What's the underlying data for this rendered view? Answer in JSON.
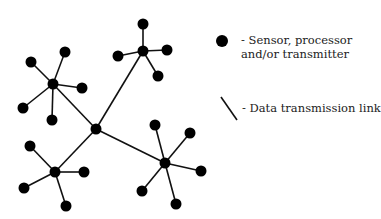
{
  "diagram": {
    "type": "network",
    "colors": {
      "node": "#000000",
      "link": "#111111"
    },
    "hubs": [
      {
        "id": "center",
        "x": 96,
        "y": 129
      },
      {
        "id": "upper-left",
        "x": 53,
        "y": 84
      },
      {
        "id": "top",
        "x": 143,
        "y": 51
      },
      {
        "id": "lower-left",
        "x": 55,
        "y": 172
      },
      {
        "id": "lower-right",
        "x": 165,
        "y": 163
      }
    ],
    "hub_links": [
      [
        "center",
        "upper-left"
      ],
      [
        "center",
        "top"
      ],
      [
        "center",
        "lower-left"
      ],
      [
        "center",
        "lower-right"
      ]
    ],
    "leaves": [
      {
        "hub": "upper-left",
        "x": 31,
        "y": 62
      },
      {
        "hub": "upper-left",
        "x": 65,
        "y": 52
      },
      {
        "hub": "upper-left",
        "x": 82,
        "y": 88
      },
      {
        "hub": "upper-left",
        "x": 23,
        "y": 108
      },
      {
        "hub": "upper-left",
        "x": 52,
        "y": 120
      },
      {
        "hub": "top",
        "x": 143,
        "y": 24
      },
      {
        "hub": "top",
        "x": 118,
        "y": 56
      },
      {
        "hub": "top",
        "x": 167,
        "y": 50
      },
      {
        "hub": "top",
        "x": 158,
        "y": 76
      },
      {
        "hub": "lower-left",
        "x": 30,
        "y": 146
      },
      {
        "hub": "lower-left",
        "x": 84,
        "y": 172
      },
      {
        "hub": "lower-left",
        "x": 24,
        "y": 188
      },
      {
        "hub": "lower-left",
        "x": 66,
        "y": 206
      },
      {
        "hub": "lower-right",
        "x": 155,
        "y": 125
      },
      {
        "hub": "lower-right",
        "x": 190,
        "y": 133
      },
      {
        "hub": "lower-right",
        "x": 201,
        "y": 171
      },
      {
        "hub": "lower-right",
        "x": 142,
        "y": 191
      },
      {
        "hub": "lower-right",
        "x": 176,
        "y": 204
      }
    ]
  },
  "legend": {
    "node_label_line1": "- Sensor, processor",
    "node_label_line2": "and/or transmitter",
    "link_label": "- Data transmission link"
  }
}
